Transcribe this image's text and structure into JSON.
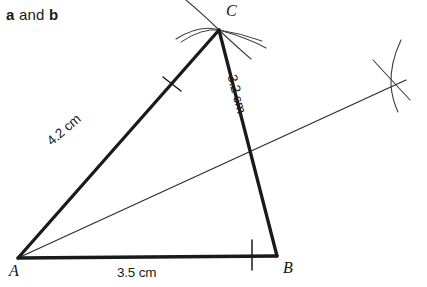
{
  "header": {
    "prefix_bold": "a",
    "middle": " and ",
    "suffix_bold": "b"
  },
  "figure": {
    "type": "geometric-construction",
    "vertices": [
      {
        "name": "A",
        "label": "A",
        "x": 18,
        "y": 258
      },
      {
        "name": "B",
        "label": "B",
        "x": 277,
        "y": 256
      },
      {
        "name": "C",
        "label": "C",
        "x": 219,
        "y": 30
      }
    ],
    "sides": [
      {
        "name": "AC",
        "label": "4.2 cm",
        "from": "A",
        "to": "C",
        "tick_marks": 1
      },
      {
        "name": "CB",
        "label": "3.2 cm",
        "from": "C",
        "to": "B",
        "tick_marks": 0
      },
      {
        "name": "AB",
        "label": "3.5 cm",
        "from": "A",
        "to": "B",
        "tick_marks": 1
      }
    ],
    "bisector": {
      "name": "angle-bisector-from-A",
      "from_x": 18,
      "from_y": 258,
      "to_x": 406,
      "to_y": 80
    },
    "construction_points": [
      {
        "name": "arc-intersection-C",
        "x": 219,
        "y": 30
      },
      {
        "name": "arc-intersection-right",
        "x": 393,
        "y": 85
      }
    ],
    "colors": {
      "triangle_stroke": "#1a1a1a",
      "construction_stroke": "#3d3d3d",
      "bisector_stroke": "#2b2b2b",
      "background": "#ffffff",
      "text": "#1a1a1a"
    },
    "stroke_widths": {
      "triangle": 3.2,
      "bisector": 1.2,
      "arc": 1.1,
      "tick": 1.3
    }
  }
}
